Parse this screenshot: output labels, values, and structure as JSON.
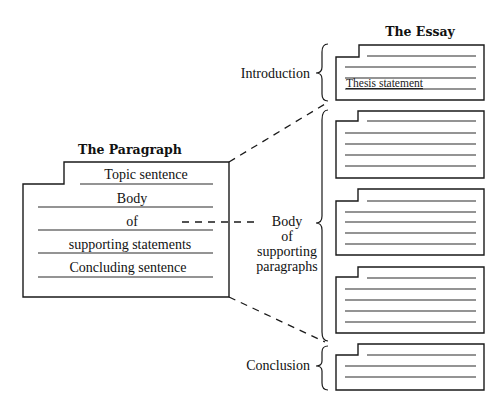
{
  "paragraph": {
    "title": "The Paragraph",
    "lines": [
      "Topic sentence",
      "Body",
      "of",
      "supporting statements",
      "Concluding sentence"
    ]
  },
  "essay": {
    "title": "The Essay",
    "introduction_label": "Introduction",
    "thesis_label": "Thesis statement",
    "body_label": [
      "Body",
      "of",
      "supporting",
      "paragraphs"
    ],
    "conclusion_label": "Conclusion",
    "body_paragraph_count": 3
  },
  "colors": {
    "ink": "#1a1a1a",
    "background": "#ffffff"
  }
}
